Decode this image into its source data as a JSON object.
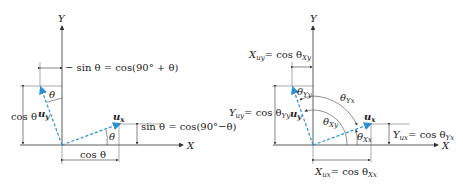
{
  "colors": {
    "vector": "#2a8fd6",
    "axis": "#333333",
    "background": "#ffffff"
  },
  "left_diagram": {
    "axis_x_label": "X",
    "axis_y_label": "Y",
    "vector_uy_label": "u",
    "vector_uy_sub": "y",
    "vector_ux_label": "u",
    "vector_ux_sub": "x",
    "top_dim_label": "− sin θ = cos(90° + θ)",
    "left_dim_label": "cos θ",
    "right_dim_label": "sin θ = cos(90°−θ)",
    "bottom_dim_label": "cos θ",
    "angle_uy_label": "θ",
    "angle_ux_label": "θ"
  },
  "right_diagram": {
    "axis_x_label": "X",
    "axis_y_label": "Y",
    "vector_uy_label": "u",
    "vector_uy_sub": "y",
    "vector_ux_label": "u",
    "vector_ux_sub": "x",
    "top_dim_label": "X",
    "top_dim_sub": "uy",
    "top_dim_rhs": "= cos θ",
    "top_dim_rhs_sub": "Xy",
    "left_dim_label": "Y",
    "left_dim_sub": "uy",
    "left_dim_rhs": "= cos θ",
    "left_dim_rhs_sub": "Yy",
    "right_dim_label": "Y",
    "right_dim_sub": "ux",
    "right_dim_rhs": "= cos θ",
    "right_dim_rhs_sub": "Yx",
    "bottom_dim_label": "X",
    "bottom_dim_sub": "ux",
    "bottom_dim_rhs": "= cos θ",
    "bottom_dim_rhs_sub": "Xx",
    "angle_theta_Yy": "θ",
    "angle_theta_Yy_sub": "Yy",
    "angle_theta_Yx": "θ",
    "angle_theta_Yx_sub": "Yx",
    "angle_theta_Xy": "θ",
    "angle_theta_Xy_sub": "Xy",
    "angle_theta_Xx": "θ",
    "angle_theta_Xx_sub": "Xx"
  }
}
